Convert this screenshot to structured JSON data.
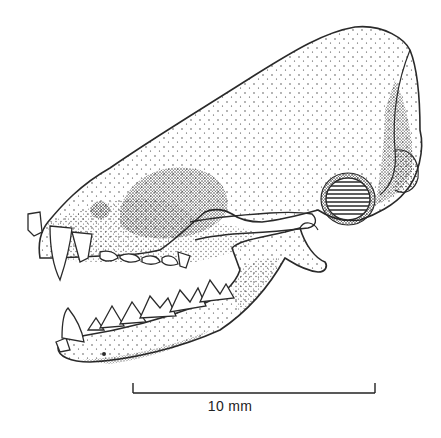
{
  "figure": {
    "view": "lateral",
    "scale_bar": {
      "label": "10 mm",
      "color": "#222222"
    },
    "ink_color": "#2a2a2a",
    "background": "#ffffff"
  }
}
